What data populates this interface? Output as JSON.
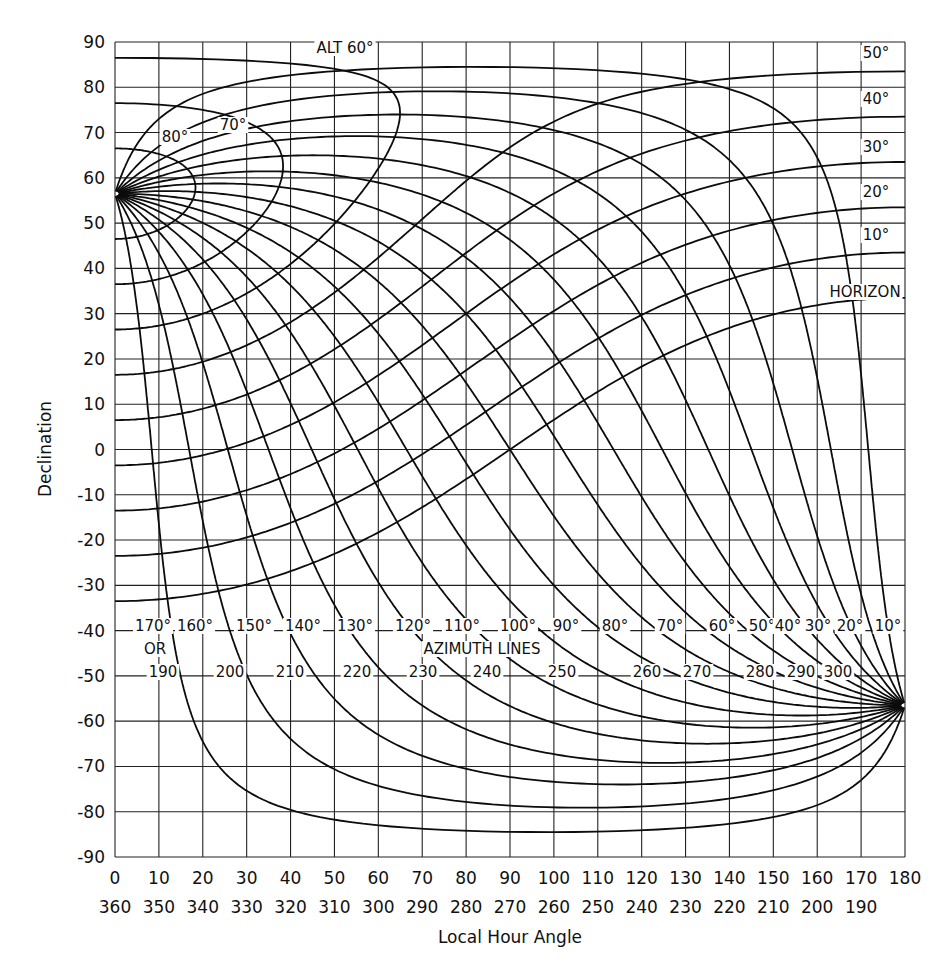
{
  "chart_data": {
    "type": "line",
    "title": "",
    "xlabel": "Local Hour Angle",
    "ylabel": "Declination",
    "xlim": [
      0,
      180
    ],
    "ylim": [
      -90,
      90
    ],
    "grid": true,
    "latitude_implied": 56.5,
    "x_ticks_primary": [
      "0",
      "10",
      "20",
      "30",
      "40",
      "50",
      "60",
      "70",
      "80",
      "90",
      "100",
      "110",
      "120",
      "130",
      "140",
      "150",
      "160",
      "170",
      "180"
    ],
    "x_ticks_secondary": [
      "360",
      "350",
      "340",
      "330",
      "320",
      "310",
      "300",
      "290",
      "280",
      "270",
      "260",
      "250",
      "240",
      "230",
      "220",
      "210",
      "200",
      "190",
      ""
    ],
    "y_ticks": [
      "90",
      "80",
      "70",
      "60",
      "50",
      "40",
      "30",
      "20",
      "10",
      "0",
      "-10",
      "-20",
      "-30",
      "-40",
      "-50",
      "-60",
      "-70",
      "-80",
      "-90"
    ],
    "altitude_series": [
      {
        "name": "HORIZON",
        "altitude": 0,
        "label": "HORIZON"
      },
      {
        "name": "10°",
        "altitude": 10,
        "label": "10°"
      },
      {
        "name": "20°",
        "altitude": 20,
        "label": "20°"
      },
      {
        "name": "30°",
        "altitude": 30,
        "label": "30°"
      },
      {
        "name": "40°",
        "altitude": 40,
        "label": "40°"
      },
      {
        "name": "50°",
        "altitude": 50,
        "label": "50°"
      },
      {
        "name": "ALT 60°",
        "altitude": 60,
        "label": "ALT 60°"
      },
      {
        "name": "70°",
        "altitude": 70,
        "label": "70°"
      },
      {
        "name": "80°",
        "altitude": 80,
        "label": "80°"
      }
    ],
    "azimuth_series": [
      {
        "azimuth": 10,
        "label_top": "10°",
        "label_bottom": ""
      },
      {
        "azimuth": 20,
        "label_top": "20°",
        "label_bottom": ""
      },
      {
        "azimuth": 30,
        "label_top": "30°",
        "label_bottom": ""
      },
      {
        "azimuth": 40,
        "label_top": "40°",
        "label_bottom": ""
      },
      {
        "azimuth": 50,
        "label_top": "50°",
        "label_bottom": "300"
      },
      {
        "azimuth": 60,
        "label_top": "60°",
        "label_bottom": "290"
      },
      {
        "azimuth": 70,
        "label_top": "70°",
        "label_bottom": "280"
      },
      {
        "azimuth": 80,
        "label_top": "80°",
        "label_bottom": "270"
      },
      {
        "azimuth": 90,
        "label_top": "90°",
        "label_bottom": "260"
      },
      {
        "azimuth": 100,
        "label_top": "100°",
        "label_bottom": "250"
      },
      {
        "azimuth": 110,
        "label_top": "110°",
        "label_bottom": "240"
      },
      {
        "azimuth": 120,
        "label_top": "120°",
        "label_bottom": "230"
      },
      {
        "azimuth": 130,
        "label_top": "130°",
        "label_bottom": "220"
      },
      {
        "azimuth": 140,
        "label_top": "140°",
        "label_bottom": "210"
      },
      {
        "azimuth": 150,
        "label_top": "150°",
        "label_bottom": "200"
      },
      {
        "azimuth": 160,
        "label_top": "160°",
        "label_bottom": "190"
      },
      {
        "azimuth": 170,
        "label_top": "170°",
        "label_bottom": ""
      }
    ],
    "annotations": {
      "azimuth_title": "AZIMUTH LINES",
      "or_text": "OR",
      "alt60": "ALT 60°",
      "horizon": "HORIZON",
      "alt_right_labels": [
        "50°",
        "40°",
        "30°",
        "20°",
        "10°"
      ],
      "alt_inner_labels": [
        "70°",
        "80°"
      ]
    },
    "convergence_points": [
      {
        "x": 0,
        "y": 56.5,
        "note": "zenith pole (left)"
      },
      {
        "x": 180,
        "y": -56.5,
        "note": "nadir pole (right)"
      }
    ]
  }
}
